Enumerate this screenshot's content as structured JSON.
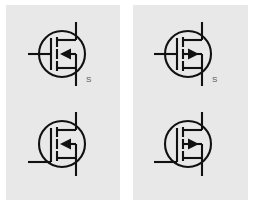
{
  "figure": {
    "title": "",
    "background_color": "#ffffff",
    "panel_color": "#e8e8e8",
    "stroke_color": "#111111"
  },
  "panels": [
    {
      "id": "left",
      "name": "p-channel-panel",
      "symbols": [
        {
          "name": "p-channel-mosfet-top",
          "device": "MOSFET",
          "channel": "p-channel",
          "arrow_direction": "left",
          "gate_lead": "middle-left",
          "drain_lead": "top-right",
          "source_lead": "bottom-right",
          "source_label": "S"
        },
        {
          "name": "p-channel-mosfet-bottom",
          "device": "MOSFET",
          "channel": "p-channel",
          "arrow_direction": "left",
          "gate_lead": "bottom-left",
          "drain_lead": "top-right",
          "source_lead": "bottom-right",
          "source_label": ""
        }
      ]
    },
    {
      "id": "right",
      "name": "n-channel-panel",
      "symbols": [
        {
          "name": "n-channel-mosfet-top",
          "device": "MOSFET",
          "channel": "n-channel",
          "arrow_direction": "right",
          "gate_lead": "middle-left",
          "drain_lead": "top-right",
          "source_lead": "bottom-right",
          "source_label": "S"
        },
        {
          "name": "n-channel-mosfet-bottom",
          "device": "MOSFET",
          "channel": "n-channel",
          "arrow_direction": "right",
          "gate_lead": "bottom-left",
          "drain_lead": "top-right",
          "source_lead": "bottom-right",
          "source_label": ""
        }
      ]
    }
  ],
  "labels": {
    "source_left": "S",
    "source_right": "S"
  },
  "bottom_strip": {
    "text": ""
  }
}
